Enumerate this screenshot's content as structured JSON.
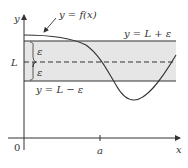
{
  "figure": {
    "type": "epsilon band limit diagram",
    "axis_labels": {
      "y": "y",
      "x": "x",
      "origin": "0"
    },
    "curve_label": "y = f(x)",
    "upper_line_label": "y = L + ε",
    "lower_line_label": "y = L − ε",
    "center_label": "L",
    "epsilon_upper": "ε",
    "epsilon_lower": "ε",
    "x_tick_label": "a",
    "colors": {
      "band_fill": "#e6e6e6",
      "lines": "#333333",
      "background": "#ffffff"
    }
  }
}
